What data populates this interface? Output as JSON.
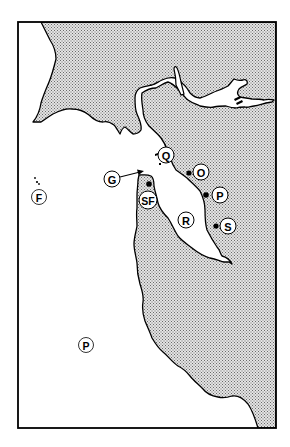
{
  "map": {
    "region": "San Francisco Bay Area",
    "colors": {
      "land_fill": "#c8c8c8",
      "water": "#ffffff",
      "outline": "#000000"
    },
    "labels": [
      {
        "id": "Q",
        "text": "Q",
        "x": 166,
        "y": 155,
        "has_dot": false
      },
      {
        "id": "O",
        "text": "O",
        "x": 201,
        "y": 172,
        "has_dot": true,
        "dot_x": 189,
        "dot_y": 173
      },
      {
        "id": "P1",
        "text": "P",
        "x": 220,
        "y": 195,
        "has_dot": true,
        "dot_x": 206,
        "dot_y": 195
      },
      {
        "id": "S",
        "text": "S",
        "x": 228,
        "y": 226,
        "has_dot": true,
        "dot_x": 216,
        "dot_y": 226
      },
      {
        "id": "R",
        "text": "R",
        "x": 186,
        "y": 220,
        "has_dot": false
      },
      {
        "id": "SF",
        "text": "SF",
        "x": 148,
        "y": 200,
        "has_dot": true,
        "dot_x": 149,
        "dot_y": 184
      },
      {
        "id": "G",
        "text": "G",
        "x": 112,
        "y": 179,
        "has_dot": false,
        "arrow_to_x": 144,
        "arrow_to_y": 171
      },
      {
        "id": "F",
        "text": "F",
        "x": 39,
        "y": 197,
        "has_dot": false
      },
      {
        "id": "P2",
        "text": "P",
        "x": 86,
        "y": 345,
        "has_dot": false
      }
    ]
  }
}
